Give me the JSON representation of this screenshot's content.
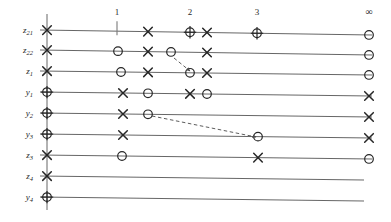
{
  "figure": {
    "kind": "lattice-diagram",
    "width": 391,
    "height": 222,
    "background": "#ffffff",
    "ink": "#262626",
    "line_color": "#555555",
    "dash_color": "#4a4a4a"
  },
  "columns": {
    "labels": [
      "1",
      "2",
      "3"
    ],
    "x": [
      117,
      190,
      257
    ],
    "infinity_label": "∞",
    "infinity_x": 369,
    "label_y": 17
  },
  "axis": {
    "vertical_line_x": 47,
    "vertical_line_top": 14,
    "vertical_line_bottom": 210
  },
  "rows": [
    {
      "label": "z",
      "sub": "21",
      "label_x": 33,
      "y_left": 30,
      "y_right": 35,
      "x_start": 40,
      "x_end": 372,
      "markers": [
        {
          "type": "cross",
          "x": 47
        },
        {
          "type": "tick",
          "x": 117
        },
        {
          "type": "cross",
          "x": 148
        },
        {
          "type": "oplus",
          "x": 190
        },
        {
          "type": "cross",
          "x": 207
        },
        {
          "type": "oplus",
          "x": 257
        },
        {
          "type": "circle",
          "x": 369
        }
      ]
    },
    {
      "label": "z",
      "sub": "22",
      "label_x": 33,
      "y_left": 50,
      "y_right": 55,
      "x_start": 40,
      "x_end": 372,
      "markers": [
        {
          "type": "cross",
          "x": 47
        },
        {
          "type": "circle",
          "x": 118
        },
        {
          "type": "cross",
          "x": 148
        },
        {
          "type": "circle",
          "x": 171
        },
        {
          "type": "cross",
          "x": 207
        },
        {
          "type": "circle",
          "x": 369
        }
      ]
    },
    {
      "label": "z",
      "sub": "1",
      "label_x": 33,
      "y_left": 71,
      "y_right": 75,
      "x_start": 40,
      "x_end": 372,
      "markers": [
        {
          "type": "cross",
          "x": 47
        },
        {
          "type": "circle",
          "x": 121
        },
        {
          "type": "cross",
          "x": 148
        },
        {
          "type": "circle",
          "x": 190
        },
        {
          "type": "cross",
          "x": 207
        },
        {
          "type": "circle",
          "x": 369
        }
      ]
    },
    {
      "label": "y",
      "sub": "1",
      "label_x": 33,
      "y_left": 92,
      "y_right": 96,
      "x_start": 40,
      "x_end": 372,
      "markers": [
        {
          "type": "oplus",
          "x": 47
        },
        {
          "type": "cross",
          "x": 123
        },
        {
          "type": "circle",
          "x": 148
        },
        {
          "type": "cross",
          "x": 190
        },
        {
          "type": "circle",
          "x": 207
        },
        {
          "type": "cross",
          "x": 369
        }
      ]
    },
    {
      "label": "y",
      "sub": "2",
      "label_x": 33,
      "y_left": 113,
      "y_right": 117,
      "x_start": 40,
      "x_end": 372,
      "markers": [
        {
          "type": "oplus",
          "x": 47
        },
        {
          "type": "cross",
          "x": 123
        },
        {
          "type": "circle",
          "x": 148
        },
        {
          "type": "cross",
          "x": 369
        }
      ]
    },
    {
      "label": "y",
      "sub": "3",
      "label_x": 33,
      "y_left": 134,
      "y_right": 138,
      "x_start": 40,
      "x_end": 372,
      "markers": [
        {
          "type": "oplus",
          "x": 47
        },
        {
          "type": "cross",
          "x": 123
        },
        {
          "type": "circle",
          "x": 258
        },
        {
          "type": "cross",
          "x": 369
        }
      ]
    },
    {
      "label": "z",
      "sub": "3",
      "label_x": 33,
      "y_left": 155,
      "y_right": 159,
      "x_start": 40,
      "x_end": 372,
      "markers": [
        {
          "type": "cross",
          "x": 47
        },
        {
          "type": "circle",
          "x": 122
        },
        {
          "type": "cross",
          "x": 258
        },
        {
          "type": "circle",
          "x": 369
        }
      ]
    },
    {
      "label": "z",
      "sub": "4",
      "label_x": 33,
      "y_left": 176,
      "y_right": 180,
      "x_start": 40,
      "x_end": 364,
      "markers": [
        {
          "type": "cross",
          "x": 47
        }
      ]
    },
    {
      "label": "y",
      "sub": "4",
      "label_x": 33,
      "y_left": 197,
      "y_right": 201,
      "x_start": 40,
      "x_end": 364,
      "markers": [
        {
          "type": "oplus",
          "x": 47
        }
      ]
    }
  ],
  "arrows": [
    {
      "name": "arrow-z22-to-z1",
      "x1": 174,
      "y1": 58,
      "x2": 190,
      "y2": 71
    },
    {
      "name": "arrow-y2-to-y3",
      "x1": 152,
      "y1": 116,
      "x2": 256,
      "y2": 137
    }
  ]
}
